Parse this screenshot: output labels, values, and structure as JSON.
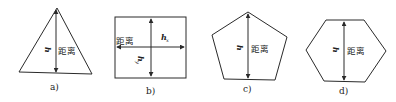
{
  "figures": [
    {
      "id": "a",
      "shape": "triangle",
      "caption": "a)",
      "height_label": "h",
      "distance_label": "距离"
    },
    {
      "id": "b",
      "shape": "square",
      "caption": "b)",
      "height_label_x": "h",
      "height_label_x_sub": "x",
      "height_label_y": "h",
      "height_label_y_sub": "y",
      "distance_label": "距离"
    },
    {
      "id": "c",
      "shape": "pentagon",
      "caption": "c)",
      "height_label": "h",
      "distance_label": "距离"
    },
    {
      "id": "d",
      "shape": "hexagon",
      "caption": "d)",
      "height_label": "h",
      "distance_label": "距离"
    }
  ],
  "colors": {
    "line": "#2a2a2a",
    "background": "#ffffff"
  }
}
